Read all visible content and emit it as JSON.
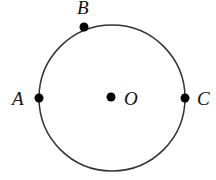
{
  "diagram": {
    "circle": {
      "cx": 112,
      "cy": 98,
      "r": 73,
      "stroke": "#333333"
    },
    "points": [
      {
        "id": "A",
        "label": "A",
        "x": 39,
        "y": 98,
        "lx": 14,
        "ly": 105
      },
      {
        "id": "B",
        "label": "B",
        "x": 84,
        "y": 27,
        "lx": 77,
        "ly": 13
      },
      {
        "id": "O",
        "label": "O",
        "x": 111,
        "y": 97,
        "lx": 124,
        "ly": 105
      },
      {
        "id": "C",
        "label": "C",
        "x": 185,
        "y": 98,
        "lx": 197,
        "ly": 105
      }
    ]
  }
}
